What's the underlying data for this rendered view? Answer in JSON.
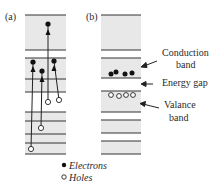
{
  "panels": {
    "a": {
      "label": "(a)"
    },
    "b": {
      "label": "(b)"
    }
  },
  "annotations": {
    "conduction_band_line1": "Conduction",
    "conduction_band_line2": "band",
    "energy_gap": "Energy gap",
    "valence_band_line1": "Valance",
    "valence_band_line2": "band"
  },
  "legend": {
    "electrons": "Electrons",
    "holes": "Holes"
  },
  "colors": {
    "band_fill": "#e6e6e6",
    "line": "#333333",
    "electron": "#111111",
    "hole_fill": "#ffffff"
  }
}
